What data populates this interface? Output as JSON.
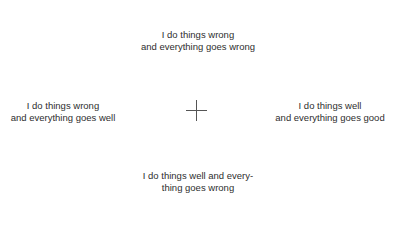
{
  "quadrants": {
    "top": {
      "line1": "I do things wrong",
      "line2": "and everything goes wrong"
    },
    "left": {
      "line1": "I do things wrong",
      "line2": "and everything goes well"
    },
    "right": {
      "line1": "I do things well",
      "line2": "and everything goes good"
    },
    "bottom": {
      "line1": "I do things well and every-",
      "line2": "thing goes wrong"
    }
  },
  "center_marker": {
    "icon": "crosshair-icon",
    "color": "#555555"
  },
  "colors": {
    "text": "#2e2e2e",
    "background": "#ffffff"
  }
}
